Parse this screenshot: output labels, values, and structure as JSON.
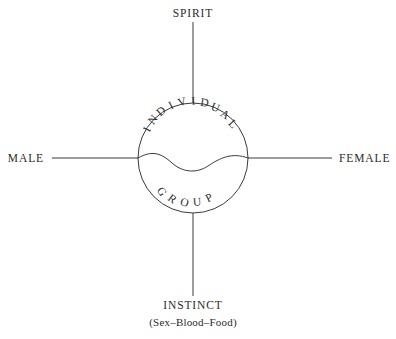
{
  "diagram": {
    "type": "cross-axis-circle-diagram",
    "background_color": "#ffffff",
    "stroke_color": "#3a3a3a",
    "text_color": "#2b2b2b",
    "axes": {
      "top_label": "SPIRIT",
      "bottom_label": "INSTINCT",
      "bottom_sublabel": "(Sex–Blood–Food)",
      "left_label": "MALE",
      "right_label": "FEMALE"
    },
    "circle": {
      "center_x": 193,
      "center_y": 158,
      "radius": 55,
      "upper_arc_text": "INDIVIDUAL",
      "lower_arc_text": "GROUP"
    }
  },
  "arc_letters": {
    "individual": [
      "I",
      "N",
      "D",
      "I",
      "V",
      "I",
      "D",
      "U",
      "A",
      "L"
    ],
    "group": [
      "G",
      "R",
      "O",
      "U",
      "P"
    ]
  }
}
